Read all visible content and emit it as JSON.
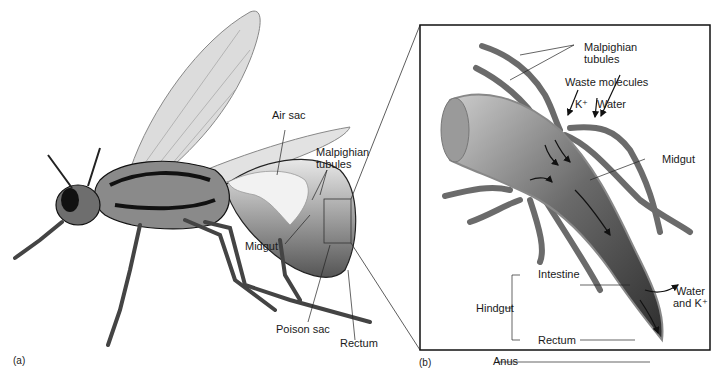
{
  "figure": {
    "panel_a": {
      "tag": "(a)",
      "labels": {
        "air_sac": "Air sac",
        "malpighian_1": "Malpighian",
        "malpighian_2": "tubules",
        "midgut": "Midgut",
        "poison_sac": "Poison sac",
        "rectum": "Rectum"
      }
    },
    "panel_b": {
      "tag": "(b)",
      "labels": {
        "malpighian_1": "Malpighian",
        "malpighian_2": "tubules",
        "waste_molecules": "Waste molecules",
        "k_plus": "K⁺",
        "water": "Water",
        "midgut": "Midgut",
        "intestine": "Intestine",
        "hindgut": "Hindgut",
        "rectum": "Rectum",
        "anus": "Anus",
        "water_and_k_1": "Water",
        "water_and_k_2": "and K⁺"
      }
    },
    "colors": {
      "line": "#222222",
      "tubule": "#6b6b6b",
      "gut_dark": "#3a3a3a",
      "gut_light": "#bdbdbd",
      "wing": "#d9d9d9"
    }
  }
}
